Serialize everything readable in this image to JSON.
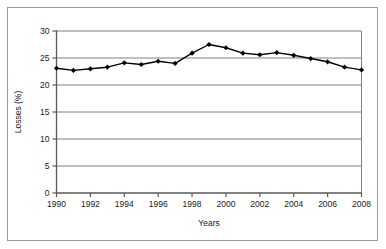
{
  "chart_data": {
    "type": "line",
    "title": "",
    "xlabel": "Years",
    "ylabel": "Losses (%)",
    "x": [
      1990,
      1991,
      1992,
      1993,
      1994,
      1995,
      1996,
      1997,
      1998,
      1999,
      2000,
      2001,
      2002,
      2003,
      2004,
      2005,
      2006,
      2007,
      2008
    ],
    "values": [
      23.1,
      22.7,
      23.0,
      23.3,
      24.1,
      23.8,
      24.4,
      24.0,
      25.9,
      27.5,
      26.9,
      25.9,
      25.6,
      26.0,
      25.5,
      24.9,
      24.3,
      23.3,
      22.8
    ],
    "series": [
      {
        "name": "Losses",
        "values": [
          23.1,
          22.7,
          23.0,
          23.3,
          24.1,
          23.8,
          24.4,
          24.0,
          25.9,
          27.5,
          26.9,
          25.9,
          25.6,
          26.0,
          25.5,
          24.9,
          24.3,
          23.3,
          22.8
        ]
      }
    ],
    "xlim": [
      1990,
      2008
    ],
    "ylim": [
      0,
      30
    ],
    "ytick_labels": [
      "0",
      "5",
      "10",
      "15",
      "20",
      "25",
      "30"
    ],
    "yticks": [
      0,
      5,
      10,
      15,
      20,
      25,
      30
    ],
    "xtick_labels": [
      "1990",
      "1992",
      "1994",
      "1996",
      "1998",
      "2000",
      "2002",
      "2004",
      "2006",
      "2008"
    ],
    "xticks": [
      1990,
      1992,
      1994,
      1996,
      1998,
      2000,
      2002,
      2004,
      2006,
      2008
    ],
    "grid": "horizontal",
    "legend": "none",
    "marker": "diamond",
    "line_color": "#000000",
    "marker_color": "#000000",
    "grid_color": "#808080",
    "axis_color": "#595959",
    "frame_color": "#9a9a9a",
    "background_color": "#ffffff"
  }
}
